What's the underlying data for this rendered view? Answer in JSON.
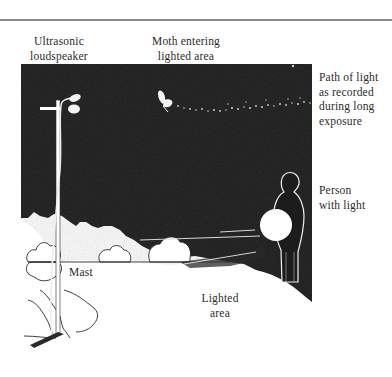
{
  "figure": {
    "labels": {
      "loudspeaker": [
        "Ultrasonic",
        "loudspeaker"
      ],
      "moth": [
        "Moth entering",
        "lighted area"
      ],
      "path": [
        "Path of light",
        "as recorded",
        "during long",
        "exposure"
      ],
      "person": [
        "Person",
        "with light"
      ],
      "mast": [
        "Mast"
      ],
      "lighted_area": [
        "Lighted",
        "area"
      ]
    },
    "colors": {
      "night": "#1c1c1c",
      "ground": "#ffffff",
      "rule": "#8a8a8a",
      "text": "#2b2b2b"
    }
  }
}
